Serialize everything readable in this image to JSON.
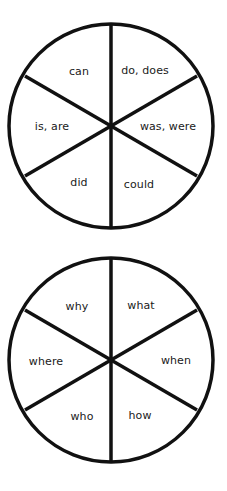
{
  "colors": {
    "stroke": "#111111",
    "background": "#ffffff",
    "text": "#1a1a1a"
  },
  "wheels": [
    {
      "name": "verbs-wheel",
      "segments": [
        {
          "label": "can",
          "position": "top-left"
        },
        {
          "label": "do, does",
          "position": "top-right"
        },
        {
          "label": "was, were",
          "position": "right"
        },
        {
          "label": "could",
          "position": "bottom-right"
        },
        {
          "label": "did",
          "position": "bottom-left"
        },
        {
          "label": "is, are",
          "position": "left"
        }
      ]
    },
    {
      "name": "question-words-wheel",
      "segments": [
        {
          "label": "why",
          "position": "top-left"
        },
        {
          "label": "what",
          "position": "top-right"
        },
        {
          "label": "when",
          "position": "right"
        },
        {
          "label": "how",
          "position": "bottom-right"
        },
        {
          "label": "who",
          "position": "bottom-left"
        },
        {
          "label": "where",
          "position": "left"
        }
      ]
    }
  ]
}
